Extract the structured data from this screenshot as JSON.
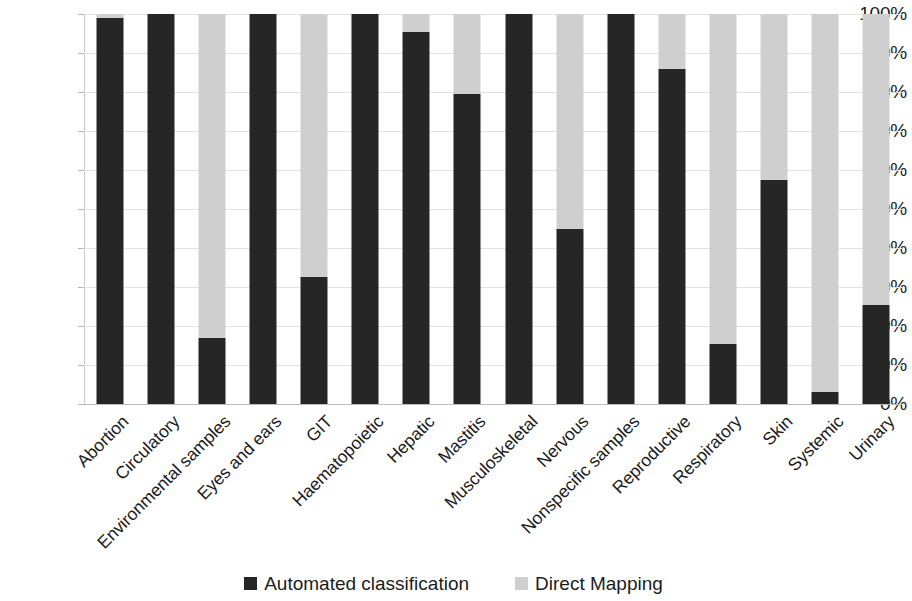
{
  "chart_data": {
    "type": "bar",
    "subtype": "stacked-100-percent",
    "title": "",
    "subtitle": "",
    "xlabel": "",
    "ylabel": "",
    "ylim": [
      0,
      100
    ],
    "y_unit": "%",
    "grid": true,
    "legend_position": "bottom",
    "y_ticks": [
      "0%",
      "10%",
      "20%",
      "30%",
      "40%",
      "50%",
      "60%",
      "70%",
      "80%",
      "90%",
      "100%"
    ],
    "y_tick_values": [
      0,
      10,
      20,
      30,
      40,
      50,
      60,
      70,
      80,
      90,
      100
    ],
    "categories": [
      "Abortion",
      "Circulatory",
      "Environmental samples",
      "Eyes and ears",
      "GIT",
      "Haematopoietic",
      "Hepatic",
      "Mastitis",
      "Musculoskeletal",
      "Nervous",
      "Nonspecific samples",
      "Reproductive",
      "Respiratory",
      "Skin",
      "Systemic",
      "Urinary"
    ],
    "series": [
      {
        "name": "Automated classification",
        "color": "#262626",
        "values": [
          99,
          100,
          17,
          100,
          32.5,
          100,
          95.5,
          79.5,
          100,
          45,
          100,
          86,
          15.5,
          57.5,
          3,
          25.5
        ]
      },
      {
        "name": "Direct Mapping",
        "color": "#cfcfcf",
        "values": [
          1,
          0,
          83,
          0,
          67.5,
          0,
          4.5,
          20.5,
          0,
          55,
          0,
          14,
          84.5,
          42.5,
          97,
          74.5
        ]
      }
    ]
  },
  "legend": {
    "items": [
      {
        "label": "Automated classification",
        "color": "#262626"
      },
      {
        "label": "Direct Mapping",
        "color": "#cfcfcf"
      }
    ]
  }
}
